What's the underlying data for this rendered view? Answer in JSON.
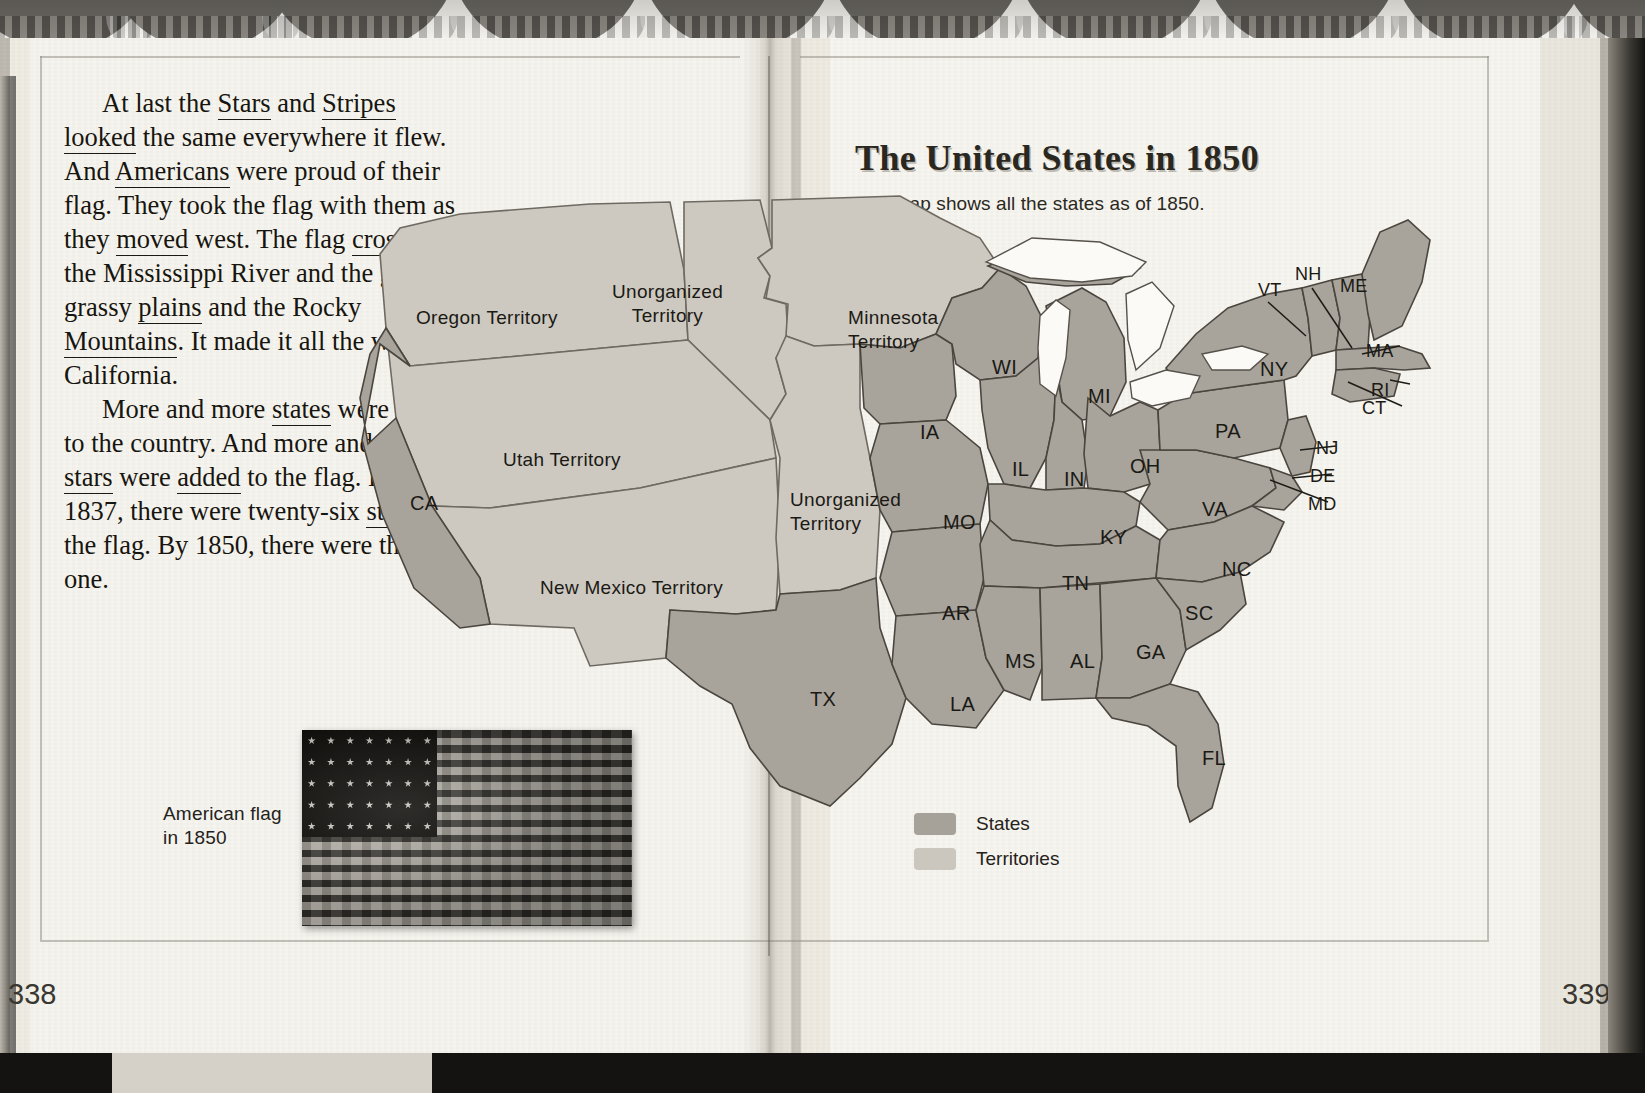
{
  "book": {
    "left_page_number": "338",
    "right_page_number": "339"
  },
  "article": {
    "paragraph_1": "At last the Stars and Stripes looked the same everywhere it flew. And Americans were proud of their flag. They took the flag with them as they moved west. The flag crossed the Mississippi River and the great grassy plains and the Rocky Mountains. It made it all the way to California.",
    "paragraph_2": "More and more states were added to the country. And more and more stars were added to the flag. By 1837, there were twenty-six stars on the flag. By 1850, there were thirty-one."
  },
  "flag_figure": {
    "caption_line_1": "American flag",
    "caption_line_2": "in 1850"
  },
  "map": {
    "title": "The United States in 1850",
    "subtitle": "This map shows all the states as of 1850.",
    "colors": {
      "states_fill": "#a8a49c",
      "territories_fill": "#cdc9c1",
      "outline": "#4a463f",
      "lake_fill": "#fbfaf6",
      "paper": "#f6f4ee",
      "text": "#1b1914"
    },
    "legend": [
      {
        "label": "States",
        "color": "#a6a29a"
      },
      {
        "label": "Territories",
        "color": "#cbc7bf"
      }
    ],
    "territories": [
      {
        "id": "oregon-territory",
        "name": "Oregon Territory",
        "lines": [
          "Oregon Territory"
        ],
        "x": 76,
        "y": 148
      },
      {
        "id": "unorganized-territory-n",
        "name": "Unorganized Territory",
        "lines": [
          "Unorganized",
          "Territory"
        ],
        "x": 272,
        "y": 122
      },
      {
        "id": "utah-territory",
        "name": "Utah Territory",
        "lines": [
          "Utah Territory"
        ],
        "x": 163,
        "y": 290
      },
      {
        "id": "new-mexico-territory",
        "name": "New Mexico Territory",
        "lines": [
          "New Mexico Territory"
        ],
        "x": 200,
        "y": 418
      },
      {
        "id": "minnesota-territory",
        "name": "Minnesota Territory",
        "lines": [
          "Minnesota",
          "Territory"
        ],
        "x": 508,
        "y": 148
      },
      {
        "id": "unorganized-territory-s",
        "name": "Unorganized Territory",
        "lines": [
          "Unorganized",
          "Territory"
        ],
        "x": 450,
        "y": 330
      }
    ],
    "states": [
      {
        "id": "CA",
        "abbr": "CA",
        "x": 70,
        "y": 334
      },
      {
        "id": "WI",
        "abbr": "WI",
        "x": 652,
        "y": 198
      },
      {
        "id": "MI",
        "abbr": "MI",
        "x": 748,
        "y": 227
      },
      {
        "id": "IA",
        "abbr": "IA",
        "x": 580,
        "y": 263
      },
      {
        "id": "IL",
        "abbr": "IL",
        "x": 672,
        "y": 300
      },
      {
        "id": "IN",
        "abbr": "IN",
        "x": 724,
        "y": 310
      },
      {
        "id": "OH",
        "abbr": "OH",
        "x": 790,
        "y": 297
      },
      {
        "id": "PA",
        "abbr": "PA",
        "x": 875,
        "y": 262
      },
      {
        "id": "NY",
        "abbr": "NY",
        "x": 920,
        "y": 200
      },
      {
        "id": "MO",
        "abbr": "MO",
        "x": 603,
        "y": 353
      },
      {
        "id": "KY",
        "abbr": "KY",
        "x": 760,
        "y": 368
      },
      {
        "id": "VA",
        "abbr": "VA",
        "x": 862,
        "y": 340
      },
      {
        "id": "NC",
        "abbr": "NC",
        "x": 882,
        "y": 400
      },
      {
        "id": "TN",
        "abbr": "TN",
        "x": 722,
        "y": 414
      },
      {
        "id": "AR",
        "abbr": "AR",
        "x": 602,
        "y": 444
      },
      {
        "id": "SC",
        "abbr": "SC",
        "x": 845,
        "y": 444
      },
      {
        "id": "MS",
        "abbr": "MS",
        "x": 665,
        "y": 492
      },
      {
        "id": "AL",
        "abbr": "AL",
        "x": 730,
        "y": 492
      },
      {
        "id": "GA",
        "abbr": "GA",
        "x": 796,
        "y": 483
      },
      {
        "id": "LA",
        "abbr": "LA",
        "x": 610,
        "y": 535
      },
      {
        "id": "TX",
        "abbr": "TX",
        "x": 470,
        "y": 530
      },
      {
        "id": "FL",
        "abbr": "FL",
        "x": 862,
        "y": 589
      }
    ],
    "leader_labels": [
      {
        "id": "VT",
        "abbr": "VT",
        "x": 918,
        "y": 122
      },
      {
        "id": "NH",
        "abbr": "NH",
        "x": 955,
        "y": 106
      },
      {
        "id": "ME",
        "abbr": "ME",
        "x": 1000,
        "y": 118
      },
      {
        "id": "MA",
        "abbr": "MA",
        "x": 1026,
        "y": 183
      },
      {
        "id": "RI",
        "abbr": "RI",
        "x": 1031,
        "y": 222
      },
      {
        "id": "CT",
        "abbr": "CT",
        "x": 1022,
        "y": 240
      },
      {
        "id": "NJ",
        "abbr": "NJ",
        "x": 976,
        "y": 280
      },
      {
        "id": "DE",
        "abbr": "DE",
        "x": 970,
        "y": 308
      },
      {
        "id": "MD",
        "abbr": "MD",
        "x": 968,
        "y": 336
      }
    ]
  }
}
